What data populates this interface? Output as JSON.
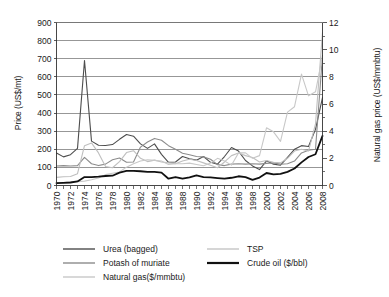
{
  "chart_data": {
    "type": "line",
    "title": "",
    "xlabel": "",
    "ylabel": "Price (US$/mt)",
    "ylabel_secondary": "Natural gas price (US$/mmbtu)",
    "ylim": [
      0,
      900
    ],
    "ylim_secondary": [
      0,
      12
    ],
    "ytick_step": 100,
    "ytick_step_secondary": 2,
    "grid": true,
    "legend_position": "bottom",
    "xlim": [
      1970,
      2008
    ],
    "x": [
      1970,
      1971,
      1972,
      1973,
      1974,
      1975,
      1976,
      1977,
      1978,
      1979,
      1980,
      1981,
      1982,
      1983,
      1984,
      1985,
      1986,
      1987,
      1988,
      1989,
      1990,
      1991,
      1992,
      1993,
      1994,
      1995,
      1996,
      1997,
      1998,
      1999,
      2000,
      2001,
      2002,
      2003,
      2004,
      2005,
      2006,
      2007,
      2008
    ],
    "xtick_labels": [
      "1970",
      "1972",
      "1974",
      "1976",
      "1978",
      "1980",
      "1982",
      "1984",
      "1986",
      "1988",
      "1990",
      "1992",
      "1994",
      "1996",
      "1998",
      "2000",
      "2002",
      "2004",
      "2006",
      "2008"
    ],
    "ytick_labels": [
      "0",
      "100",
      "200",
      "300",
      "400",
      "500",
      "600",
      "700",
      "800",
      "900"
    ],
    "ytick_labels_secondary": [
      "0",
      "2",
      "4",
      "6",
      "8",
      "10",
      "12"
    ],
    "series": [
      {
        "name": "Urea (bagged)",
        "axis": "left",
        "color": "#4d4d4d",
        "width": 1.1,
        "values": [
          180,
          158,
          170,
          205,
          690,
          245,
          222,
          221,
          226,
          255,
          282,
          272,
          230,
          205,
          230,
          172,
          128,
          130,
          160,
          148,
          140,
          160,
          128,
          118,
          160,
          210,
          190,
          138,
          108,
          88,
          136,
          118,
          112,
          155,
          200,
          220,
          215,
          310,
          485
        ]
      },
      {
        "name": "Potash of muriate",
        "axis": "left",
        "color": "#8c8c8c",
        "width": 1.1,
        "values": [
          108,
          110,
          108,
          110,
          155,
          120,
          110,
          118,
          142,
          152,
          128,
          130,
          212,
          240,
          260,
          250,
          220,
          200,
          178,
          170,
          160,
          158,
          145,
          115,
          110,
          118,
          120,
          118,
          120,
          118,
          122,
          125,
          118,
          120,
          135,
          180,
          195,
          200,
          718
        ]
      },
      {
        "name": "TSP",
        "axis": "left",
        "color": "#bfbfbf",
        "width": 1.1,
        "values": [
          45,
          48,
          50,
          65,
          220,
          235,
          180,
          105,
          98,
          132,
          182,
          192,
          150,
          132,
          140,
          130,
          125,
          120,
          135,
          145,
          138,
          125,
          112,
          98,
          130,
          165,
          180,
          165,
          155,
          130,
          138,
          128,
          125,
          150,
          190,
          200,
          190,
          340,
          845
        ]
      },
      {
        "name": "Natural gas($/mmbtu)",
        "axis": "right",
        "color": "#c8c8c8",
        "width": 1.1,
        "values": [
          0.2,
          0.22,
          0.25,
          0.28,
          0.32,
          0.42,
          0.55,
          0.8,
          0.9,
          1.0,
          1.35,
          1.6,
          1.8,
          1.9,
          1.85,
          1.8,
          1.55,
          1.6,
          1.6,
          1.65,
          1.55,
          1.45,
          1.65,
          2.0,
          1.8,
          1.5,
          2.4,
          2.4,
          2.0,
          2.2,
          4.25,
          3.95,
          3.25,
          5.4,
          5.8,
          8.2,
          6.6,
          6.9,
          9.5
        ]
      },
      {
        "name": "Crude oil ($/bbl)",
        "axis": "right",
        "color": "#111111",
        "width": 1.8,
        "values": [
          0.18,
          0.2,
          0.22,
          0.3,
          0.62,
          0.62,
          0.65,
          0.7,
          0.72,
          0.95,
          1.08,
          1.08,
          1.05,
          1.0,
          1.0,
          0.95,
          0.5,
          0.62,
          0.5,
          0.6,
          0.75,
          0.62,
          0.6,
          0.55,
          0.5,
          0.57,
          0.68,
          0.62,
          0.42,
          0.58,
          0.92,
          0.82,
          0.85,
          1.0,
          1.25,
          1.7,
          2.1,
          2.3,
          3.65
        ]
      }
    ]
  },
  "legend": {
    "entries": [
      {
        "label": "Urea (bagged)",
        "color": "#4d4d4d",
        "width": 1.4
      },
      {
        "label": "TSP",
        "color": "#c4c4c4",
        "width": 1.4
      },
      {
        "label": "Potash of muriate",
        "color": "#8c8c8c",
        "width": 1.4
      },
      {
        "label": "Crude oil ($/bbl)",
        "color": "#111111",
        "width": 2.2
      },
      {
        "label": "Natural gas($/mmbtu)",
        "color": "#c8c8c8",
        "width": 1.4
      }
    ]
  },
  "axes": {
    "left_title": "Price (US$/mt)",
    "right_title": "Natural gas price (US$/mmbtu)"
  }
}
